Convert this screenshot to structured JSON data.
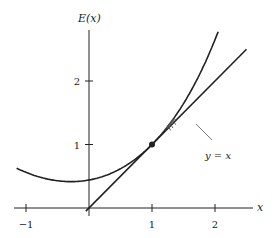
{
  "figure": {
    "y_axis_label": "E(x)",
    "x_axis_label": "x",
    "line_label": "y = x",
    "x_ticks": [
      {
        "value": -1,
        "label": "−1"
      },
      {
        "value": 1,
        "label": "1"
      },
      {
        "value": 2,
        "label": "2"
      }
    ],
    "y_ticks": [
      {
        "value": 1,
        "label": "1"
      },
      {
        "value": 2,
        "label": "2"
      }
    ],
    "x_range": [
      -1.15,
      2.6
    ],
    "y_range": [
      -0.1,
      2.9
    ],
    "curve": {
      "name": "E(x)",
      "description": "convex increasing curve tangent to y = x at (1,1)"
    },
    "line": {
      "name": "y = x",
      "x_range": [
        0,
        2.5
      ]
    },
    "fixed_point": {
      "x": 1,
      "y": 1
    },
    "cobweb": {
      "start_x": 1.25,
      "steps": 3,
      "arrows": "upward on vertical segments"
    },
    "colors": {
      "ink": "#222222",
      "thin": "#555555",
      "background": "#ffffff"
    }
  }
}
